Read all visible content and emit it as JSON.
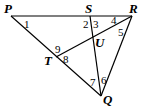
{
  "diagram": {
    "points": [
      {
        "id": "P",
        "label": "P"
      },
      {
        "id": "S",
        "label": "S"
      },
      {
        "id": "R",
        "label": "R"
      },
      {
        "id": "U",
        "label": "U"
      },
      {
        "id": "T",
        "label": "T"
      },
      {
        "id": "Q",
        "label": "Q"
      }
    ],
    "segments": [
      {
        "from": "P",
        "to": "R"
      },
      {
        "from": "P",
        "to": "Q"
      },
      {
        "from": "R",
        "to": "Q"
      },
      {
        "from": "S",
        "to": "Q"
      },
      {
        "from": "R",
        "to": "T"
      }
    ],
    "angles": [
      "1",
      "2",
      "3",
      "4",
      "5",
      "6",
      "7",
      "8",
      "9"
    ]
  }
}
